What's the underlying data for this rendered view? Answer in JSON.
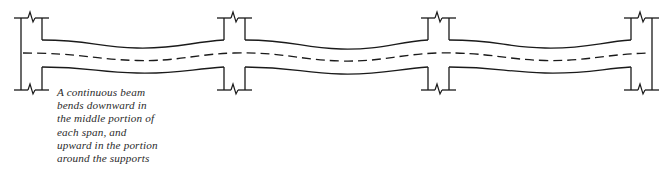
{
  "figure": {
    "name": "continuous-beam-deflection-diagram",
    "type": "structural-engineering-line-drawing",
    "background_color": "#ffffff",
    "line_color": "#1a1a1a",
    "caption_color": "#2b2b2b"
  },
  "caption": {
    "full_text": "A continuous beam bends downward in the middle portion of each span, and upward in the portion around the supports",
    "lines": [
      "A continuous beam",
      "bends downward in",
      "the middle portion of",
      "each span, and",
      "upward in the portion",
      "around the supports"
    ]
  },
  "structure": {
    "span_count": 3,
    "support_count": 4,
    "supports": [
      {
        "label": "left-end-column",
        "x": 31,
        "type": "end",
        "width": 22
      },
      {
        "label": "interior-column-1",
        "x": 234,
        "type": "interior",
        "width": 22
      },
      {
        "label": "interior-column-2",
        "x": 438,
        "type": "interior",
        "width": 22
      },
      {
        "label": "right-end-column",
        "x": 641,
        "type": "end",
        "width": 22
      }
    ],
    "column_top_y": 16,
    "column_bottom_y": 92,
    "break_symbol": "zigzag-break",
    "break_symbol_count": 8,
    "beam_depth": 26,
    "beam_centerline_style": "dashed",
    "deflection": {
      "description": "exaggerated elastic curve; sagging at midspan, hogging over supports",
      "midspan_sag_px": 8,
      "support_level_y": 53
    }
  }
}
